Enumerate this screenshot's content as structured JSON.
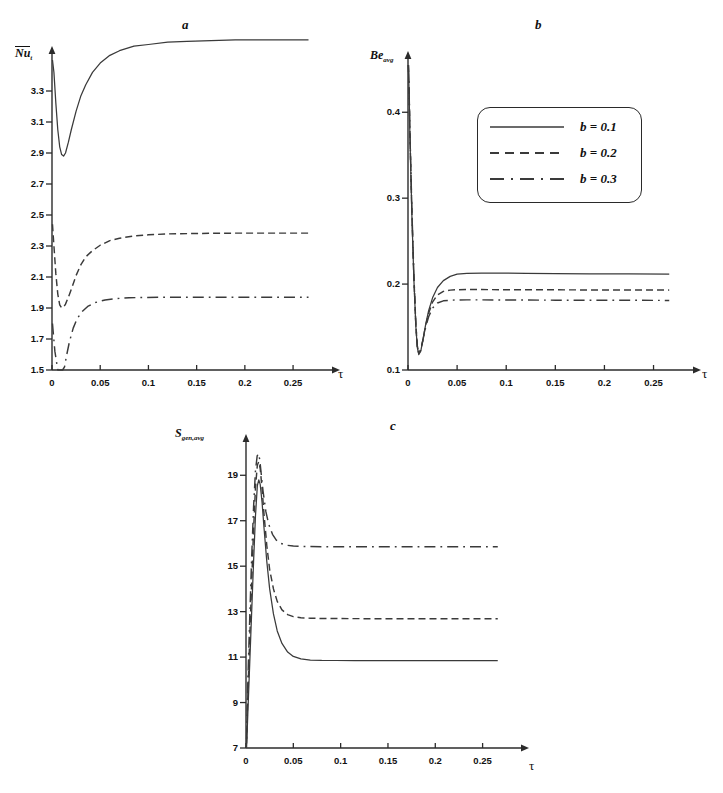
{
  "figure": {
    "panels": [
      "a",
      "b",
      "c"
    ],
    "axis_color": "#2b2b2b",
    "curve_color": "#3a3a3a"
  },
  "legend": {
    "entries": [
      {
        "label": "b = 0.1",
        "style": "solid",
        "swatch": "legend-solid-line"
      },
      {
        "label": "b = 0.2",
        "style": "dashed",
        "swatch": "legend-dashed-line"
      },
      {
        "label": "b = 0.3",
        "style": "dashdot",
        "swatch": "legend-dashdot-line"
      }
    ]
  },
  "panel_a": {
    "label": "a",
    "ylabel": "Nu",
    "ylabel_sub": "t",
    "xlabel": "τ"
  },
  "panel_b": {
    "label": "b",
    "ylabel": "Be",
    "ylabel_sub": "avg",
    "xlabel": "τ"
  },
  "panel_c": {
    "label": "c",
    "ylabel": "S",
    "ylabel_sub": "gen,avg",
    "xlabel": "τ"
  },
  "chart_data": [
    {
      "type": "line",
      "panel": "a",
      "title": "a",
      "xlabel": "τ",
      "ylabel": "Nu_t (overbar, time-averaged Nusselt number)",
      "xlim": [
        0,
        0.28
      ],
      "ylim": [
        1.5,
        3.5
      ],
      "xticks": [
        0,
        0.05,
        0.1,
        0.15,
        0.2,
        0.25
      ],
      "xticklabels": [
        "0",
        "0.05",
        "0.1",
        "0.15",
        "0.2",
        "0.25"
      ],
      "yticks": [
        1.5,
        1.7,
        1.9,
        2.1,
        2.3,
        2.5,
        2.7,
        2.9,
        3.1,
        3.3
      ],
      "yticklabels": [
        "1.5",
        "1.7",
        "1.9",
        "2.1",
        "2.3",
        "2.5",
        "2.7",
        "2.9",
        "3.1",
        "3.3"
      ],
      "grid": false,
      "legend_position": "none",
      "series": [
        {
          "name": "b = 0.1",
          "style": "solid",
          "x": [
            0.0005,
            0.002,
            0.004,
            0.006,
            0.008,
            0.01,
            0.012,
            0.014,
            0.017,
            0.02,
            0.025,
            0.03,
            0.035,
            0.042,
            0.05,
            0.06,
            0.07,
            0.085,
            0.1,
            0.12,
            0.14,
            0.165,
            0.19,
            0.22,
            0.25,
            0.266
          ],
          "y": [
            3.5,
            3.42,
            3.22,
            3.05,
            2.94,
            2.89,
            2.88,
            2.9,
            2.97,
            3.05,
            3.17,
            3.27,
            3.34,
            3.42,
            3.48,
            3.53,
            3.56,
            3.59,
            3.6,
            3.615,
            3.62,
            3.625,
            3.63,
            3.63,
            3.63,
            3.63
          ]
        },
        {
          "name": "b = 0.2",
          "style": "dashed",
          "x": [
            0.0005,
            0.002,
            0.004,
            0.006,
            0.008,
            0.01,
            0.012,
            0.014,
            0.017,
            0.02,
            0.025,
            0.03,
            0.035,
            0.042,
            0.05,
            0.06,
            0.07,
            0.085,
            0.1,
            0.12,
            0.14,
            0.165,
            0.19,
            0.22,
            0.25,
            0.266
          ],
          "y": [
            2.44,
            2.3,
            2.12,
            1.99,
            1.92,
            1.9,
            1.905,
            1.925,
            1.97,
            2.02,
            2.11,
            2.18,
            2.23,
            2.27,
            2.305,
            2.335,
            2.35,
            2.365,
            2.372,
            2.378,
            2.38,
            2.382,
            2.383,
            2.383,
            2.383,
            2.383
          ]
        },
        {
          "name": "b = 0.3",
          "style": "dashdot",
          "x": [
            0.0005,
            0.003,
            0.006,
            0.009,
            0.011,
            0.013,
            0.015,
            0.018,
            0.022,
            0.026,
            0.031,
            0.037,
            0.045,
            0.055,
            0.065,
            0.08,
            0.095,
            0.115,
            0.14,
            0.17,
            0.2,
            0.235,
            0.266
          ],
          "y": [
            1.8,
            1.62,
            1.5,
            1.46,
            1.47,
            1.52,
            1.59,
            1.68,
            1.77,
            1.83,
            1.875,
            1.91,
            1.935,
            1.952,
            1.96,
            1.966,
            1.968,
            1.97,
            1.97,
            1.97,
            1.97,
            1.97,
            1.97
          ]
        }
      ]
    },
    {
      "type": "line",
      "panel": "b",
      "title": "b",
      "xlabel": "τ",
      "ylabel": "Be_avg (average Bejan number)",
      "xlim": [
        0,
        0.28
      ],
      "ylim": [
        0.1,
        0.455
      ],
      "xticks": [
        0,
        0.05,
        0.1,
        0.15,
        0.2,
        0.25
      ],
      "xticklabels": [
        "0",
        "0.05",
        "0.1",
        "0.15",
        "0.2",
        "0.25"
      ],
      "yticks": [
        0.1,
        0.2,
        0.3,
        0.4
      ],
      "yticklabels": [
        "0.1",
        "0.2",
        "0.3",
        "0.4"
      ],
      "grid": false,
      "legend_position": "upper-center-inside",
      "series": [
        {
          "name": "b = 0.1",
          "style": "solid",
          "x": [
            0.0004,
            0.001,
            0.002,
            0.004,
            0.006,
            0.008,
            0.0095,
            0.011,
            0.013,
            0.015,
            0.018,
            0.021,
            0.025,
            0.03,
            0.036,
            0.043,
            0.05,
            0.06,
            0.075,
            0.095,
            0.12,
            0.15,
            0.185,
            0.225,
            0.266
          ],
          "y": [
            0.455,
            0.43,
            0.37,
            0.278,
            0.205,
            0.15,
            0.126,
            0.118,
            0.122,
            0.134,
            0.153,
            0.169,
            0.184,
            0.196,
            0.204,
            0.209,
            0.2115,
            0.2125,
            0.2128,
            0.2127,
            0.2125,
            0.2122,
            0.212,
            0.2118,
            0.2117
          ]
        },
        {
          "name": "b = 0.2",
          "style": "dashed",
          "x": [
            0.0004,
            0.001,
            0.002,
            0.004,
            0.006,
            0.008,
            0.0095,
            0.011,
            0.013,
            0.015,
            0.018,
            0.021,
            0.025,
            0.03,
            0.036,
            0.043,
            0.05,
            0.06,
            0.075,
            0.095,
            0.12,
            0.15,
            0.185,
            0.225,
            0.266
          ],
          "y": [
            0.455,
            0.432,
            0.374,
            0.282,
            0.208,
            0.152,
            0.127,
            0.119,
            0.123,
            0.134,
            0.152,
            0.166,
            0.179,
            0.1875,
            0.1915,
            0.193,
            0.1935,
            0.1936,
            0.1936,
            0.1935,
            0.1934,
            0.1933,
            0.1932,
            0.1931,
            0.193
          ]
        },
        {
          "name": "b = 0.3",
          "style": "dashdot",
          "x": [
            0.0004,
            0.001,
            0.002,
            0.004,
            0.006,
            0.008,
            0.0095,
            0.011,
            0.013,
            0.015,
            0.018,
            0.021,
            0.025,
            0.03,
            0.036,
            0.043,
            0.05,
            0.06,
            0.075,
            0.095,
            0.12,
            0.15,
            0.185,
            0.225,
            0.266
          ],
          "y": [
            0.455,
            0.433,
            0.376,
            0.285,
            0.21,
            0.153,
            0.128,
            0.12,
            0.124,
            0.134,
            0.15,
            0.162,
            0.172,
            0.178,
            0.1805,
            0.1812,
            0.1815,
            0.1816,
            0.1816,
            0.1815,
            0.1814,
            0.1813,
            0.1812,
            0.1811,
            0.181
          ]
        }
      ]
    },
    {
      "type": "line",
      "panel": "c",
      "title": "c",
      "xlabel": "τ",
      "ylabel": "S_gen,avg (average entropy generation)",
      "xlim": [
        0,
        0.28
      ],
      "ylim": [
        7,
        20.2
      ],
      "xticks": [
        0,
        0.05,
        0.1,
        0.15,
        0.2,
        0.25
      ],
      "xticklabels": [
        "0",
        "0.05",
        "0.1",
        "0.15",
        "0.2",
        "0.25"
      ],
      "yticks": [
        7,
        9,
        11,
        13,
        15,
        17,
        19
      ],
      "yticklabels": [
        "7",
        "9",
        "11",
        "13",
        "15",
        "17",
        "19"
      ],
      "grid": false,
      "legend_position": "none",
      "series": [
        {
          "name": "b = 0.1",
          "style": "solid",
          "x": [
            0.0006,
            0.002,
            0.004,
            0.006,
            0.008,
            0.01,
            0.012,
            0.0135,
            0.015,
            0.017,
            0.019,
            0.022,
            0.025,
            0.029,
            0.033,
            0.038,
            0.044,
            0.05,
            0.058,
            0.068,
            0.08,
            0.095,
            0.115,
            0.14,
            0.17,
            0.205,
            0.24,
            0.266
          ],
          "y": [
            7.0,
            8.6,
            10.8,
            13.0,
            15.2,
            17.2,
            18.55,
            18.8,
            18.6,
            17.8,
            16.7,
            15.2,
            14.0,
            12.9,
            12.15,
            11.6,
            11.22,
            11.03,
            10.92,
            10.87,
            10.855,
            10.85,
            10.848,
            10.846,
            10.845,
            10.845,
            10.845,
            10.845
          ]
        },
        {
          "name": "b = 0.2",
          "style": "dashed",
          "x": [
            0.0006,
            0.002,
            0.004,
            0.006,
            0.008,
            0.01,
            0.012,
            0.0135,
            0.015,
            0.017,
            0.019,
            0.022,
            0.025,
            0.029,
            0.033,
            0.038,
            0.044,
            0.05,
            0.058,
            0.068,
            0.08,
            0.095,
            0.115,
            0.14,
            0.17,
            0.205,
            0.24,
            0.266
          ],
          "y": [
            7.2,
            9.4,
            11.9,
            14.3,
            16.6,
            18.45,
            19.45,
            19.6,
            19.3,
            18.4,
            17.3,
            15.9,
            14.85,
            14.0,
            13.45,
            13.08,
            12.87,
            12.78,
            12.73,
            12.71,
            12.7,
            12.695,
            12.692,
            12.69,
            12.69,
            12.69,
            12.69,
            12.69
          ]
        },
        {
          "name": "b = 0.3",
          "style": "dashdot",
          "x": [
            0.0006,
            0.002,
            0.004,
            0.006,
            0.008,
            0.01,
            0.0118,
            0.0132,
            0.0145,
            0.016,
            0.018,
            0.021,
            0.024,
            0.028,
            0.032,
            0.037,
            0.043,
            0.05,
            0.058,
            0.068,
            0.08,
            0.095,
            0.115,
            0.14,
            0.17,
            0.205,
            0.24,
            0.266
          ],
          "y": [
            7.4,
            10.0,
            12.8,
            15.4,
            17.6,
            19.2,
            19.85,
            19.95,
            19.7,
            19.1,
            18.3,
            17.4,
            16.85,
            16.4,
            16.15,
            16.0,
            15.92,
            15.885,
            15.87,
            15.862,
            15.858,
            15.856,
            15.855,
            15.855,
            15.855,
            15.855,
            15.855,
            15.855
          ]
        }
      ]
    }
  ]
}
